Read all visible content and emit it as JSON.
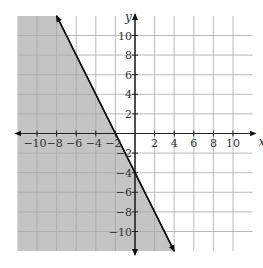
{
  "chart_data": {
    "type": "line",
    "title": "",
    "xlabel": "x",
    "ylabel": "y",
    "xlim": [
      -12,
      12
    ],
    "ylim": [
      -12,
      12
    ],
    "grid": true,
    "grid_step": 2,
    "x_ticks": [
      -10,
      -8,
      -6,
      -4,
      -2,
      2,
      4,
      6,
      8,
      10
    ],
    "y_ticks": [
      10,
      8,
      6,
      4,
      2,
      -2,
      -4,
      -6,
      -8,
      -10
    ],
    "x_tick_labels": [
      "−10",
      "−8",
      "−6",
      "−4",
      "−2",
      "2",
      "4",
      "6",
      "8",
      "10"
    ],
    "y_tick_labels": [
      "10",
      "8",
      "6",
      "4",
      "2",
      "−2",
      "−4",
      "−6",
      "−8",
      "−10"
    ],
    "series": [
      {
        "name": "boundary line",
        "equation": "y = -2x - 4",
        "style": "solid",
        "arrows": "both",
        "points": [
          [
            -8,
            12
          ],
          [
            4,
            -12
          ]
        ]
      }
    ],
    "shaded_region": {
      "description": "y <= -2x - 4",
      "side": "left/below the line",
      "color": "#c4c4c4"
    }
  },
  "colors": {
    "shade": "#c4c4c4",
    "grid": "#a8a8a8",
    "axis": "#222222",
    "line": "#111111"
  }
}
